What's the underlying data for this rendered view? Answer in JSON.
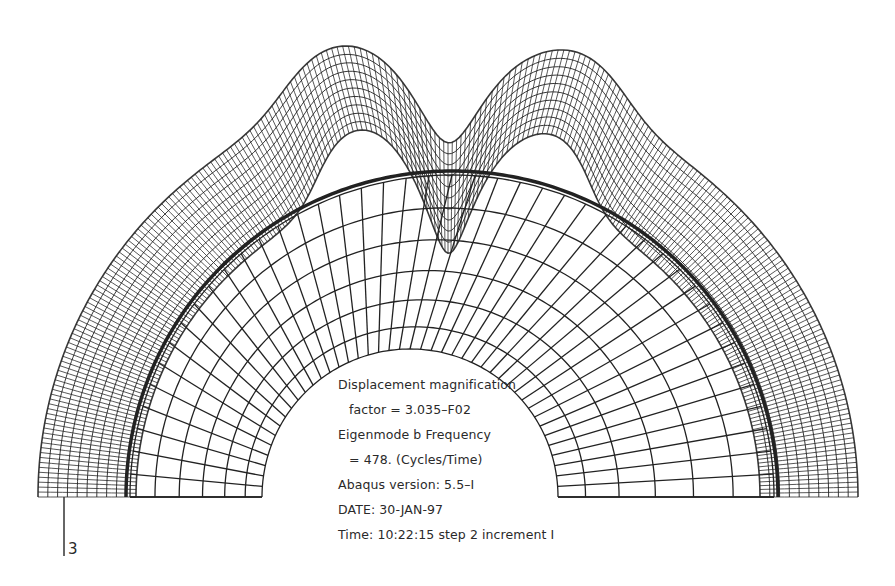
{
  "figure": {
    "background": "#ffffff",
    "ink_color": "#222222"
  },
  "annotation": {
    "line1": "Displacement magnification",
    "line2": "factor = 3.035–F02",
    "line3": "Eigenmode b  Frequency",
    "line4": "= 478. (Cycles/Time)",
    "line5": "Abaqus version: 5.5–I",
    "line6": "DATE: 30-JAN-97",
    "line7": "Time: 10:22:15 step 2 increment I"
  },
  "axis": {
    "label": "3"
  },
  "geometry": {
    "baseline_y": 497,
    "inner": {
      "cx": 410,
      "r": 148
    },
    "undeformed_outer": {
      "cx": 452,
      "r": 322
    },
    "deformed_outer": {
      "cx": 448,
      "r": 410
    },
    "radial_lines": 44,
    "rings": 6,
    "peaks": [
      {
        "angle_deg": 104,
        "height": 120,
        "width_deg": 10
      },
      {
        "angle_deg": 74,
        "height": 118,
        "width_deg": 10
      },
      {
        "angle_deg": 90,
        "height": -150,
        "width_deg": 6
      }
    ]
  }
}
